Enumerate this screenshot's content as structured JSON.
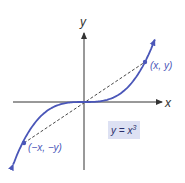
{
  "diagram": {
    "type": "function-graph",
    "function": "y = x^3",
    "axes": {
      "x_label": "x",
      "y_label": "y"
    },
    "points": [
      {
        "label": "(x, y)"
      },
      {
        "label": "(−x, −y)"
      }
    ],
    "equation_label": {
      "base": "y = x",
      "exponent": "3"
    },
    "colors": {
      "curve": "#4a56b8",
      "axis": "#333333",
      "dashed": "#333333",
      "label_box": "#dde1f3",
      "label_text": "#4a56b8"
    }
  }
}
